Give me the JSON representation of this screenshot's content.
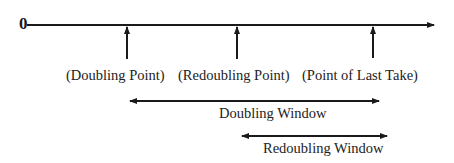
{
  "diagram": {
    "origin_label": "0",
    "timeline": {
      "y": 25,
      "x_start": 27,
      "x_end": 434
    },
    "points": [
      {
        "id": "doubling-point",
        "label": "(Doubling Point)",
        "x": 127,
        "label_x": 66
      },
      {
        "id": "redoubling-point",
        "label": "(Redoubling Point)",
        "x": 237,
        "label_x": 178
      },
      {
        "id": "point-of-last-take",
        "label": "(Point of Last Take)",
        "x": 373,
        "label_x": 302
      }
    ],
    "windows": [
      {
        "id": "doubling-window",
        "label": "Doubling Window",
        "x1": 128,
        "x2": 380,
        "y": 101,
        "label_x": 219,
        "label_y": 118
      },
      {
        "id": "redoubling-window",
        "label": "Redoubling Window",
        "x1": 240,
        "x2": 388,
        "y": 136,
        "label_x": 263,
        "label_y": 153
      }
    ],
    "colors": {
      "line": "#1a1a1a",
      "text": "#222222",
      "background": "#ffffff"
    }
  }
}
